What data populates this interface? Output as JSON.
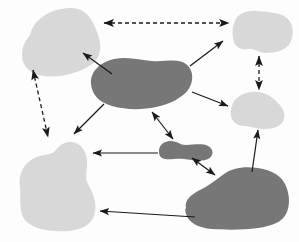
{
  "canvas": {
    "width": 299,
    "height": 242,
    "background": "#fdfdfd"
  },
  "palette": {
    "light_blob": "#d8d8d8",
    "dark_blob": "#777777",
    "arrow_solid": "#1a1a1a",
    "arrow_dashed": "#1a1a1a"
  },
  "diagram": {
    "type": "blob-connection-diagram",
    "shape_count": 8,
    "connector_count": 12,
    "light_shape_count": 4,
    "dark_shape_count": 4
  },
  "shapes": [
    {
      "id": "blob-top-left",
      "tone": "light",
      "fill": "#d8d8d8",
      "cx": 55,
      "cy": 45,
      "path": "M 30 35 C 34 18 52 8 72 8 C 88 9 94 22 99 38 C 103 52 98 62 86 68 C 74 74 58 78 44 76 C 30 74 22 66 22 55 C 22 46 26 40 30 35 Z"
    },
    {
      "id": "blob-center-dark",
      "tone": "dark",
      "fill": "#777777",
      "cx": 140,
      "cy": 84,
      "path": "M 91 84 C 90 72 100 62 114 59 C 128 56 140 60 152 61 C 166 62 178 58 186 64 C 194 70 194 82 188 90 C 182 98 170 104 156 107 C 142 110 126 110 112 106 C 98 102 92 94 91 84 Z"
    },
    {
      "id": "blob-top-right",
      "tone": "light",
      "fill": "#d8d8d8",
      "cx": 262,
      "cy": 33,
      "path": "M 234 24 C 236 14 246 10 258 11 C 270 12 282 13 288 19 C 294 25 294 36 290 43 C 286 50 276 53 266 53 C 258 53 254 48 248 49 C 242 50 236 48 234 42 C 232 36 232 29 234 24 Z"
    },
    {
      "id": "blob-mid-right",
      "tone": "light",
      "fill": "#d8d8d8",
      "cx": 262,
      "cy": 110,
      "path": "M 232 106 C 234 98 242 93 252 92 C 262 91 270 95 276 101 C 282 107 286 112 284 119 C 282 126 274 129 264 129 C 256 129 250 126 244 126 C 238 126 232 122 231 116 C 230 111 231 108 232 106 Z"
    },
    {
      "id": "blob-small-dark-center",
      "tone": "dark",
      "fill": "#777777",
      "cx": 185,
      "cy": 150,
      "path": "M 159 151 C 159 145 164 141 171 141 C 177 141 180 145 186 145 C 194 145 202 143 208 146 C 214 149 214 156 208 159 C 202 162 192 160 184 159 C 176 158 170 160 165 159 C 160 158 159 155 159 151 Z"
    },
    {
      "id": "blob-bottom-left",
      "tone": "light",
      "fill": "#d8d8d8",
      "cx": 60,
      "cy": 190,
      "path": "M 20 186 C 18 172 26 160 40 156 C 46 154 50 155 54 152 C 58 148 62 142 70 142 C 80 142 86 150 87 160 C 88 170 84 176 88 184 C 93 194 97 202 95 212 C 93 224 82 230 68 231 C 52 232 36 230 27 222 C 18 214 21 198 20 186 Z"
    },
    {
      "id": "blob-bottom-right",
      "tone": "dark",
      "fill": "#777777",
      "cx": 242,
      "cy": 196,
      "path": "M 186 208 C 184 200 192 194 200 190 C 208 186 216 180 224 174 C 232 168 244 166 258 168 C 272 170 282 176 286 186 C 290 196 290 206 286 214 C 282 222 272 226 258 228 C 244 230 226 230 212 229 C 198 228 188 222 186 214 C 185 211 185 209 186 208 Z"
    },
    {
      "id": "blob-dark-center-lobe",
      "tone": "dark",
      "fill": "#777777",
      "cx": 150,
      "cy": 90,
      "path": "M 118 95 C 116 88 122 82 130 80 C 138 78 146 82 152 86 C 158 90 160 96 156 101 C 152 106 142 107 134 105 C 126 103 120 100 118 95 Z"
    }
  ],
  "connectors": [
    {
      "id": "conn-topleft-topright-dashed",
      "style": "dashed",
      "heads": "both",
      "from": "blob-top-left",
      "to": "blob-top-right",
      "x1": 104,
      "y1": 23,
      "x2": 229,
      "y2": 23
    },
    {
      "id": "conn-topleft-bottomleft-dashed",
      "style": "dashed",
      "heads": "both",
      "from": "blob-top-left",
      "to": "blob-bottom-left",
      "x1": 33,
      "y1": 70,
      "x2": 48,
      "y2": 137
    },
    {
      "id": "conn-topright-midright-dashed",
      "style": "dashed",
      "heads": "both",
      "from": "blob-top-right",
      "to": "blob-mid-right",
      "x1": 259,
      "y1": 56,
      "x2": 259,
      "y2": 90
    },
    {
      "id": "conn-center-topleft-solid",
      "style": "solid",
      "heads": "end",
      "from": "blob-center-dark",
      "to": "blob-top-left",
      "x1": 112,
      "y1": 74,
      "x2": 83,
      "y2": 53
    },
    {
      "id": "conn-center-topright-solid",
      "style": "solid",
      "heads": "end",
      "from": "blob-center-dark",
      "to": "blob-top-right",
      "x1": 190,
      "y1": 66,
      "x2": 223,
      "y2": 41
    },
    {
      "id": "conn-center-midright-solid",
      "style": "solid",
      "heads": "end",
      "from": "blob-center-dark",
      "to": "blob-mid-right",
      "x1": 192,
      "y1": 92,
      "x2": 228,
      "y2": 106
    },
    {
      "id": "conn-center-bottomleft-solid",
      "style": "solid",
      "heads": "end",
      "from": "blob-center-dark",
      "to": "blob-bottom-left",
      "x1": 104,
      "y1": 104,
      "x2": 74,
      "y2": 134
    },
    {
      "id": "conn-center-smalldark-solid",
      "style": "solid",
      "heads": "both",
      "from": "blob-center-dark",
      "to": "blob-small-dark-center",
      "x1": 152,
      "y1": 112,
      "x2": 173,
      "y2": 139
    },
    {
      "id": "conn-smalldark-bottomleft-solid",
      "style": "solid",
      "heads": "end",
      "from": "blob-small-dark-center",
      "to": "blob-bottom-left",
      "x1": 158,
      "y1": 153,
      "x2": 93,
      "y2": 153
    },
    {
      "id": "conn-smalldark-bottomright-solid",
      "style": "solid",
      "heads": "both",
      "from": "blob-small-dark-center",
      "to": "blob-bottom-right",
      "x1": 192,
      "y1": 158,
      "x2": 215,
      "y2": 175
    },
    {
      "id": "conn-bottomright-midright-solid",
      "style": "solid",
      "heads": "end",
      "from": "blob-bottom-right",
      "to": "blob-mid-right",
      "x1": 252,
      "y1": 172,
      "x2": 258,
      "y2": 130
    },
    {
      "id": "conn-bottomright-bottomleft-solid",
      "style": "solid",
      "heads": "end",
      "from": "blob-bottom-right",
      "to": "blob-bottom-left",
      "x1": 195,
      "y1": 217,
      "x2": 100,
      "y2": 211
    }
  ]
}
